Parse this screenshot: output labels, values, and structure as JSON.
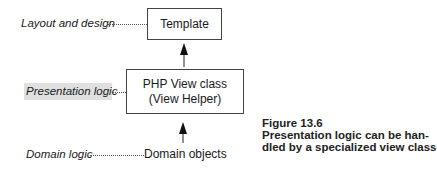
{
  "diagram": {
    "labels": {
      "layout": "Layout and design",
      "presentation": "Presentation logic",
      "domain": "Domain logic"
    },
    "boxes": {
      "template": "Template",
      "view_class_line1": "PHP View class",
      "view_class_line2": "(View Helper)",
      "domain_objects": "Domain objects"
    },
    "highlight_color": "#e0e0e0"
  },
  "caption": {
    "figure_number": "Figure 13.6",
    "line1": "Presentation logic can be han-",
    "line2": "dled by a specialized view class"
  }
}
